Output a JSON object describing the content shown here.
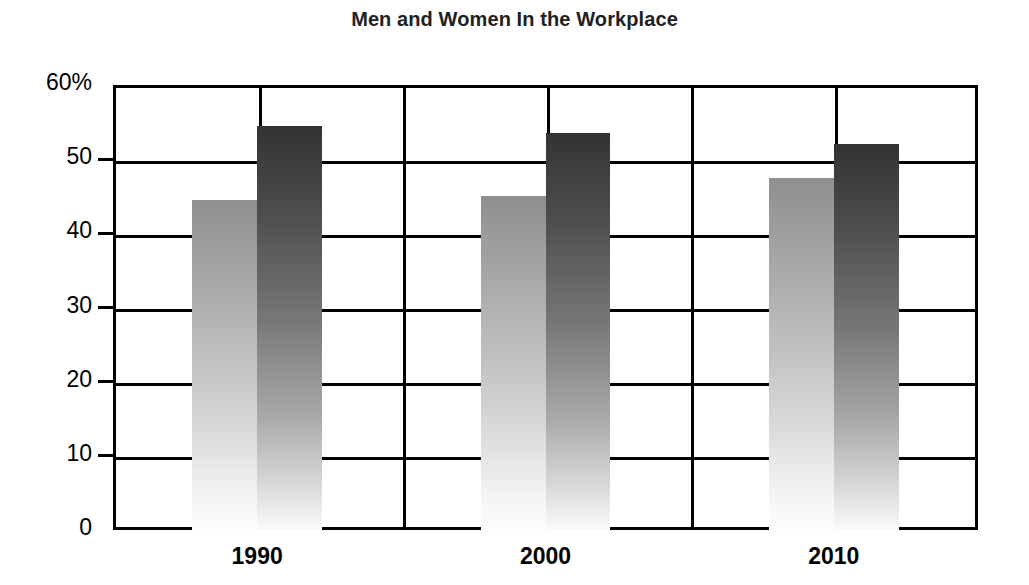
{
  "chart_data": {
    "type": "bar",
    "title": "Men and Women In the Workplace",
    "xlabel": "",
    "ylabel": "",
    "categories": [
      "1990",
      "2000",
      "2010"
    ],
    "series": [
      {
        "name": "Men",
        "values": [
          44.5,
          45.0,
          47.5
        ],
        "color": "#9a9a9a"
      },
      {
        "name": "Women",
        "values": [
          54.5,
          53.5,
          52.0
        ],
        "color": "#3a3a3a"
      }
    ],
    "ylim": [
      0,
      60
    ],
    "yticks": [
      0,
      10,
      20,
      30,
      40,
      50,
      60
    ],
    "ytick_labels": [
      "0",
      "10",
      "20",
      "30",
      "40",
      "50",
      "60%"
    ],
    "grid": true,
    "grid_axis": "both",
    "legend": "none",
    "value_unit": "percent",
    "bar_style": "vertical gradient, dark at top fading to white at bottom"
  },
  "axes": {
    "y_ticks": [
      {
        "label": "60%",
        "value": 60
      },
      {
        "label": "50",
        "value": 50
      },
      {
        "label": "40",
        "value": 40
      },
      {
        "label": "30",
        "value": 30
      },
      {
        "label": "20",
        "value": 20
      },
      {
        "label": "10",
        "value": 10
      },
      {
        "label": "0",
        "value": 0
      }
    ],
    "x_ticks": [
      {
        "label": "1990"
      },
      {
        "label": "2000"
      },
      {
        "label": "2010"
      }
    ]
  },
  "colors": {
    "axis": "#000000",
    "title": "#231f20",
    "background": "#ffffff",
    "bar_men_top": "#8f8f8f",
    "bar_women_top": "#333333"
  }
}
